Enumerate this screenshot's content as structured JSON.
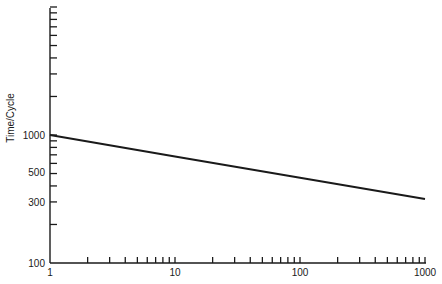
{
  "chart_data": {
    "type": "line",
    "title": "",
    "xlabel": "",
    "ylabel": "Time/Cycle",
    "x_scale": "log",
    "y_scale": "log",
    "xlim": [
      1,
      1000
    ],
    "ylim": [
      100,
      10000
    ],
    "x_tick_labels": [
      "1",
      "10",
      "100",
      "1000"
    ],
    "y_tick_labels": [
      "100",
      "300",
      "500",
      "1000"
    ],
    "grid": false,
    "legend": null,
    "series": [
      {
        "name": "Time/Cycle",
        "x": [
          1,
          10,
          100,
          1000
        ],
        "y": [
          1000,
          681,
          464,
          316
        ]
      }
    ]
  },
  "labels": {
    "ylabel": "Time/Cycle",
    "x1": "1",
    "x10": "10",
    "x100": "100",
    "x1000": "1000",
    "y100": "100",
    "y300": "300",
    "y500": "500",
    "y1000": "1000"
  }
}
